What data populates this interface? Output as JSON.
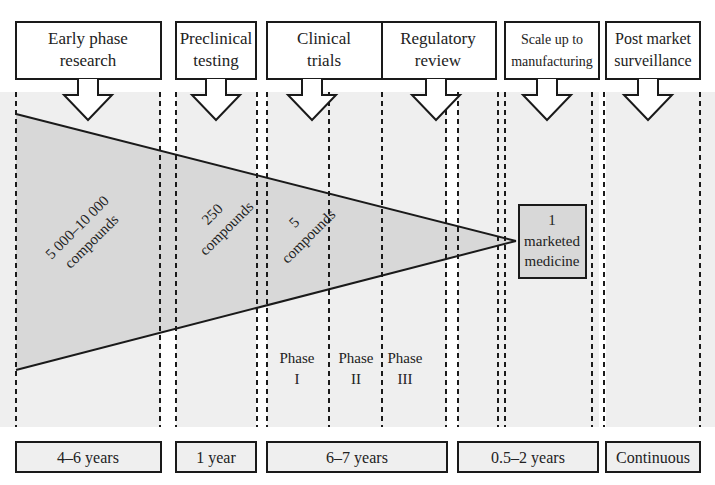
{
  "title_fragment": "Drug Discovery and Development Process Timeline",
  "stages": [
    {
      "id": "early-phase-research",
      "label_lines": [
        "Early phase",
        "research"
      ],
      "x": 16,
      "w": 145,
      "duration": "4–6 years"
    },
    {
      "id": "preclinical-testing",
      "label_lines": [
        "Preclinical",
        "testing"
      ],
      "x": 176,
      "w": 80,
      "duration": "1 year"
    },
    {
      "id": "clinical-trials",
      "label_lines": [
        "Clinical",
        "trials"
      ],
      "x": 267,
      "w": 115,
      "duration": "6–7 years"
    },
    {
      "id": "regulatory-review",
      "label_lines": [
        "Regulatory",
        "review"
      ],
      "x": 382,
      "w": 114,
      "duration": null
    },
    {
      "id": "scale-up-to-manufacturing",
      "label_lines": [
        "Scale up to",
        "manufacturing"
      ],
      "x": 505,
      "w": 94,
      "duration": "0.5–2 years"
    },
    {
      "id": "post-market-surveillance",
      "label_lines": [
        "Post market",
        "surveillance"
      ],
      "x": 606,
      "w": 94,
      "duration": "Continuous"
    }
  ],
  "funnel_labels": {
    "early": [
      "5 000–10 000",
      "compounds"
    ],
    "preclinical": [
      "250",
      "compounds"
    ],
    "clinical": [
      "5",
      "compounds"
    ]
  },
  "phases": [
    {
      "label": "Phase",
      "numeral": "I"
    },
    {
      "label": "Phase",
      "numeral": "II"
    },
    {
      "label": "Phase",
      "numeral": "III"
    }
  ],
  "outcome": {
    "lines": [
      "1",
      "marketed",
      "medicine"
    ]
  },
  "durations": [
    {
      "label": "4–6 years",
      "x": 16,
      "w": 145
    },
    {
      "label": "1 year",
      "x": 176,
      "w": 80
    },
    {
      "label": "6–7 years",
      "x": 267,
      "w": 180
    },
    {
      "label": "0.5–2 years",
      "x": 458,
      "w": 140
    },
    {
      "label": "Continuous",
      "x": 606,
      "w": 94
    }
  ],
  "colors": {
    "band": "#efefef",
    "funnel": "#d8d8d8",
    "box": "#f5f5f5",
    "stroke": "#1a1a1a"
  }
}
